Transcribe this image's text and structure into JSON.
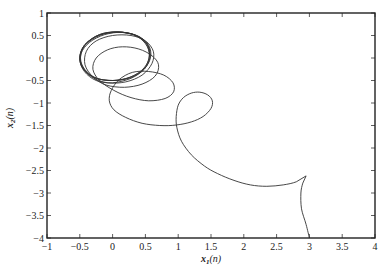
{
  "chart_data": {
    "type": "line",
    "title": "",
    "xlabel": "x1(n)",
    "ylabel": "x2(n)",
    "xlim": [
      -1,
      4
    ],
    "ylim": [
      -4,
      1
    ],
    "grid": false,
    "legend": null,
    "x_ticks": [
      -1,
      -0.5,
      0,
      0.5,
      1,
      1.5,
      2,
      2.5,
      3,
      3.5,
      4
    ],
    "x_tick_labels": [
      "-1",
      "-0.5",
      "0",
      "0.5",
      "1",
      "1.5",
      "2",
      "2.5",
      "3",
      "3.5",
      "4"
    ],
    "y_ticks": [
      1,
      0.5,
      0,
      -0.5,
      -1,
      -1.5,
      -2,
      -2.5,
      -3,
      -3.5,
      -4
    ],
    "y_tick_labels": [
      "1",
      "0.5",
      "0",
      "-0.5",
      "-1",
      "-1.5",
      "-2",
      "-2.5",
      "-3",
      "-3.5",
      "-4"
    ],
    "series": [
      {
        "name": "trajectory",
        "color": "#333333",
        "points": [
          [
            3.0,
            -4.0
          ],
          [
            2.95,
            -3.7
          ],
          [
            2.88,
            -3.35
          ],
          [
            2.87,
            -3.0
          ],
          [
            2.9,
            -2.78
          ],
          [
            2.95,
            -2.62
          ],
          [
            2.8,
            -2.75
          ],
          [
            2.6,
            -2.82
          ],
          [
            2.35,
            -2.85
          ],
          [
            2.1,
            -2.82
          ],
          [
            1.85,
            -2.72
          ],
          [
            1.6,
            -2.57
          ],
          [
            1.4,
            -2.4
          ],
          [
            1.2,
            -2.15
          ],
          [
            1.05,
            -1.85
          ],
          [
            0.98,
            -1.55
          ],
          [
            0.97,
            -1.3
          ],
          [
            1.0,
            -1.05
          ],
          [
            1.08,
            -0.88
          ],
          [
            1.2,
            -0.78
          ],
          [
            1.33,
            -0.76
          ],
          [
            1.45,
            -0.82
          ],
          [
            1.52,
            -0.95
          ],
          [
            1.5,
            -1.12
          ],
          [
            1.38,
            -1.3
          ],
          [
            1.2,
            -1.42
          ],
          [
            0.97,
            -1.49
          ],
          [
            0.72,
            -1.5
          ],
          [
            0.45,
            -1.45
          ],
          [
            0.2,
            -1.32
          ],
          [
            0.02,
            -1.15
          ],
          [
            -0.05,
            -0.95
          ],
          [
            -0.02,
            -0.72
          ],
          [
            0.1,
            -0.48
          ],
          [
            0.3,
            -0.32
          ],
          [
            0.55,
            -0.3
          ],
          [
            0.78,
            -0.38
          ],
          [
            0.92,
            -0.55
          ],
          [
            0.93,
            -0.75
          ],
          [
            0.8,
            -0.9
          ],
          [
            0.55,
            -0.95
          ],
          [
            0.28,
            -0.88
          ],
          [
            0.02,
            -0.72
          ],
          [
            -0.2,
            -0.5
          ],
          [
            -0.3,
            -0.25
          ],
          [
            -0.25,
            0.0
          ],
          [
            -0.08,
            0.18
          ],
          [
            0.15,
            0.25
          ],
          [
            0.4,
            0.2
          ],
          [
            0.6,
            0.05
          ],
          [
            0.7,
            -0.15
          ],
          [
            0.65,
            -0.4
          ],
          [
            0.45,
            -0.58
          ],
          [
            0.18,
            -0.65
          ],
          [
            -0.1,
            -0.6
          ],
          [
            -0.3,
            -0.42
          ],
          [
            -0.42,
            -0.15
          ],
          [
            -0.4,
            0.15
          ],
          [
            -0.25,
            0.38
          ],
          [
            0.0,
            0.5
          ],
          [
            0.28,
            0.5
          ],
          [
            0.5,
            0.38
          ],
          [
            0.62,
            0.15
          ],
          [
            0.6,
            -0.12
          ],
          [
            0.45,
            -0.38
          ],
          [
            0.2,
            -0.53
          ],
          [
            -0.08,
            -0.55
          ],
          [
            -0.32,
            -0.42
          ],
          [
            -0.47,
            -0.18
          ],
          [
            -0.48,
            0.1
          ],
          [
            -0.35,
            0.35
          ],
          [
            -0.12,
            0.52
          ],
          [
            0.15,
            0.57
          ],
          [
            0.4,
            0.48
          ],
          [
            0.55,
            0.28
          ],
          [
            0.58,
            0.02
          ],
          [
            0.48,
            -0.25
          ],
          [
            0.28,
            -0.45
          ],
          [
            0.0,
            -0.55
          ],
          [
            -0.25,
            -0.5
          ],
          [
            -0.43,
            -0.3
          ],
          [
            -0.5,
            -0.02
          ],
          [
            -0.43,
            0.28
          ],
          [
            -0.22,
            0.5
          ],
          [
            0.05,
            0.58
          ],
          [
            0.32,
            0.52
          ],
          [
            0.5,
            0.32
          ],
          [
            0.56,
            0.05
          ],
          [
            0.48,
            -0.22
          ],
          [
            0.28,
            -0.42
          ],
          [
            0.02,
            -0.5
          ],
          [
            -0.24,
            -0.45
          ],
          [
            -0.42,
            -0.26
          ],
          [
            -0.49,
            0.0
          ],
          [
            -0.42,
            0.28
          ],
          [
            -0.2,
            0.5
          ],
          [
            0.08,
            0.57
          ],
          [
            0.35,
            0.5
          ],
          [
            0.52,
            0.3
          ],
          [
            0.56,
            0.02
          ],
          [
            0.47,
            -0.25
          ],
          [
            0.26,
            -0.43
          ],
          [
            0.0,
            -0.5
          ],
          [
            -0.27,
            -0.44
          ],
          [
            -0.44,
            -0.24
          ],
          [
            -0.5,
            0.02
          ],
          [
            -0.42,
            0.3
          ],
          [
            -0.2,
            0.52
          ],
          [
            0.08,
            0.58
          ],
          [
            0.36,
            0.5
          ],
          [
            0.53,
            0.3
          ],
          [
            0.57,
            0.02
          ],
          [
            0.48,
            -0.25
          ],
          [
            0.27,
            -0.44
          ],
          [
            0.0,
            -0.5
          ],
          [
            -0.27,
            -0.44
          ],
          [
            -0.45,
            -0.24
          ],
          [
            -0.5,
            0.02
          ],
          [
            -0.42,
            0.3
          ],
          [
            -0.2,
            0.52
          ],
          [
            0.08,
            0.58
          ],
          [
            0.36,
            0.5
          ],
          [
            0.53,
            0.3
          ],
          [
            0.57,
            0.02
          ]
        ]
      }
    ]
  },
  "plot": {
    "pixel_box": {
      "left": 47,
      "top": 13,
      "right": 375,
      "bottom": 238
    }
  }
}
